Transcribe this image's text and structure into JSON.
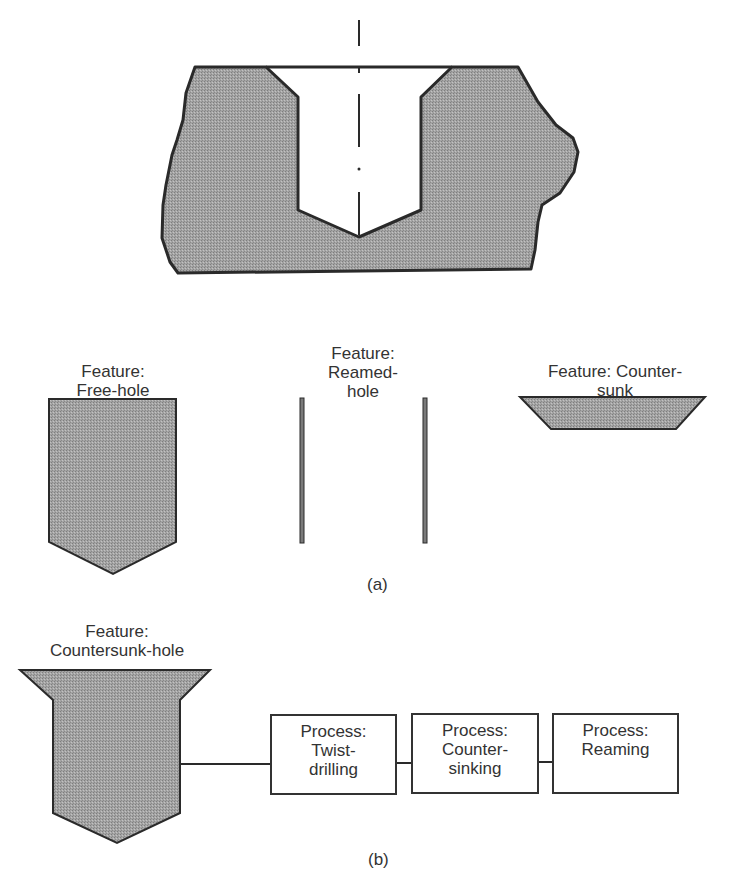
{
  "figure": {
    "fill_color": "#9a9a9a",
    "stroke_color": "#2a2a2a",
    "part_a": {
      "caption": "(a)",
      "features": [
        {
          "label": "Feature:\nFree-hole"
        },
        {
          "label": "Feature:\nReamed-\nhole"
        },
        {
          "label": "Feature: Counter-\nsunk"
        }
      ]
    },
    "part_b": {
      "caption": "(b)",
      "feature_label": "Feature:\nCountersunk-hole",
      "processes": [
        {
          "label": "Process:\nTwist-\ndrilling"
        },
        {
          "label": "Process:\nCounter-\nsinking"
        },
        {
          "label": "Process:\nReaming"
        }
      ]
    }
  }
}
